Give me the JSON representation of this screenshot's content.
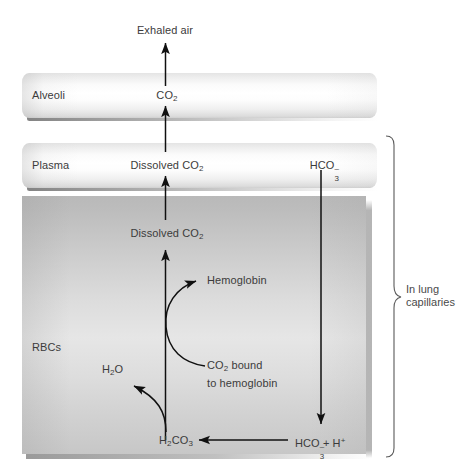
{
  "diagram": {
    "colors": {
      "text": "#3b3b3b",
      "stroke": "#1a1a1a",
      "band_light": "#ffffff",
      "band_edge": "#cfcfcf",
      "rbc_fill": "#d2d2d2"
    }
  },
  "labels": {
    "exhaled_air": "Exhaled air",
    "alveoli": "Alveoli",
    "co2_alveoli": "CO",
    "co2_alveoli_sub": "2",
    "plasma": "Plasma",
    "dissolved_co2_plasma": "Dissolved CO",
    "dissolved_co2_plasma_sub": "2",
    "bicarbonate_plasma": "HCO",
    "bicarbonate_plasma_sub": "3",
    "bicarbonate_plasma_sup": "–",
    "dissolved_co2_rbc": "Dissolved CO",
    "dissolved_co2_rbc_sub": "2",
    "hemoglobin": "Hemoglobin",
    "rbcs": "RBCs",
    "water": "H",
    "water_sub": "2",
    "water_tail": "O",
    "co2_bound_line1": "CO",
    "co2_bound_line1_sub": "2",
    "co2_bound_line1_tail": " bound",
    "co2_bound_line2": "to hemoglobin",
    "carbonic_acid": "H",
    "carbonic_acid_sub1": "2",
    "carbonic_acid_mid": "CO",
    "carbonic_acid_sub2": "3",
    "bicarbonate_rbc": "HCO",
    "bicarbonate_rbc_sub": "3",
    "bicarbonate_rbc_sup": "–",
    "bicarbonate_rbc_tail": " + H",
    "proton_sup": "+",
    "brace_line1": "In lung",
    "brace_line2": "capillaries"
  },
  "flow": {
    "steps": [
      "CO2 bound to hemoglobin is released from hemoglobin inside RBCs",
      "HCO3- + H+ combine to form H2CO3 inside RBCs",
      "H2CO3 dissociates into H2O and dissolved CO2",
      "Dissolved CO2 diffuses from RBCs into plasma",
      "Dissolved CO2 diffuses from plasma into alveoli as CO2",
      "CO2 leaves the alveoli as exhaled air"
    ],
    "compartments": [
      "Alveoli",
      "Plasma",
      "RBCs"
    ],
    "bracket_scope": "In lung capillaries"
  }
}
